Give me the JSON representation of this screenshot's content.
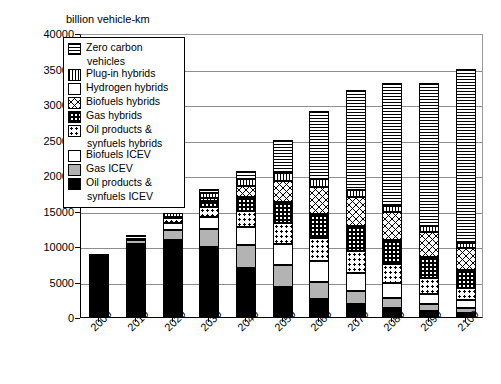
{
  "chart_data": {
    "type": "bar",
    "stacked": true,
    "title": "",
    "ylabel": "billion vehicle-km",
    "xlabel": "",
    "ylim": [
      0,
      40000
    ],
    "ytick_labels": [
      "0",
      "5000",
      "10000",
      "15000",
      "20000",
      "25000",
      "30000",
      "35000",
      "40000"
    ],
    "ytick_values": [
      0,
      5000,
      10000,
      15000,
      20000,
      25000,
      30000,
      35000,
      40000
    ],
    "grid": "horizontal",
    "legend_position": "upper-left-inside",
    "categories": [
      "2000",
      "2010",
      "2020",
      "2030",
      "2040",
      "2050",
      "2060",
      "2070",
      "2080",
      "2090",
      "2100"
    ],
    "series": [
      {
        "name": "Oil products & synfuels ICEV",
        "pattern": "solid-black",
        "color": "#000000",
        "values": [
          8900,
          10300,
          10800,
          9800,
          6900,
          4200,
          2500,
          1800,
          1300,
          900,
          600
        ]
      },
      {
        "name": "Gas ICEV",
        "pattern": "solid-grey",
        "color": "#b3b3b3",
        "values": [
          0,
          600,
          1500,
          2600,
          3300,
          3100,
          2500,
          1900,
          1400,
          900,
          700
        ]
      },
      {
        "name": "Biofuels ICEV",
        "pattern": "solid-white",
        "color": "#ffffff",
        "values": [
          0,
          300,
          900,
          1700,
          2500,
          3000,
          2900,
          2500,
          2100,
          1500,
          1100
        ]
      },
      {
        "name": "Oil products & synfuels hybrids",
        "pattern": "dots",
        "color": "#ffffff",
        "values": [
          0,
          0,
          700,
          1400,
          2300,
          3000,
          3200,
          3100,
          2700,
          2200,
          1700
        ]
      },
      {
        "name": "Gas hybrids",
        "pattern": "grid-dense",
        "color": "#ffffff",
        "values": [
          0,
          0,
          200,
          800,
          1900,
          2900,
          3400,
          3500,
          3300,
          2900,
          2500
        ]
      },
      {
        "name": "Biofuels hybrids",
        "pattern": "cross-hatch",
        "color": "#ffffff",
        "values": [
          0,
          0,
          0,
          400,
          1600,
          3000,
          3800,
          4100,
          4000,
          3600,
          3100
        ]
      },
      {
        "name": "Plug-in hybrids",
        "pattern": "vertical-lines",
        "color": "#ffffff",
        "values": [
          0,
          200,
          500,
          800,
          1000,
          1100,
          1100,
          1000,
          900,
          800,
          700
        ]
      },
      {
        "name": "Hydrogen hybrids",
        "pattern": "white",
        "color": "#ffffff",
        "values": [
          0,
          0,
          0,
          0,
          0,
          0,
          0,
          0,
          0,
          0,
          0
        ]
      },
      {
        "name": "Zero carbon vehicles",
        "pattern": "horizontal-lines",
        "color": "#ffffff",
        "values": [
          0,
          0,
          0,
          500,
          1000,
          4700,
          9600,
          14100,
          17300,
          20200,
          24600
        ]
      }
    ]
  },
  "legend": {
    "items": [
      {
        "label": "Zero carbon",
        "label2": "vehicles",
        "pattern": "p-zero"
      },
      {
        "label": "Plug-in hybrids",
        "label2": "",
        "pattern": "p-plugin"
      },
      {
        "label": "Hydrogen hybrids",
        "label2": "",
        "pattern": "p-h2"
      },
      {
        "label": "Biofuels hybrids",
        "label2": "",
        "pattern": "p-bioh"
      },
      {
        "label": "Gas hybrids",
        "label2": "",
        "pattern": "p-gash"
      },
      {
        "label": "Oil products &",
        "label2": "synfuels hybrids",
        "pattern": "p-oilh"
      },
      {
        "label": "Biofuels ICEV",
        "label2": "",
        "pattern": "p-bioi"
      },
      {
        "label": "Gas ICEV",
        "label2": "",
        "pattern": "p-gasi"
      },
      {
        "label": "Oil products &",
        "label2": "synfuels ICEV",
        "pattern": "p-oili"
      }
    ]
  }
}
